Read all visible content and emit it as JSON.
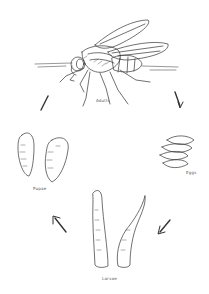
{
  "diagram": {
    "stages": [
      {
        "id": "adult",
        "label": "Adults"
      },
      {
        "id": "eggs",
        "label": "Eggs"
      },
      {
        "id": "larvae",
        "label": "Larvae"
      },
      {
        "id": "pupae",
        "label": "Pupae"
      }
    ],
    "cycle_order": [
      "adult",
      "eggs",
      "larvae",
      "pupae",
      "adult"
    ],
    "colors": {
      "line": "#333333",
      "background": "#ffffff"
    }
  }
}
